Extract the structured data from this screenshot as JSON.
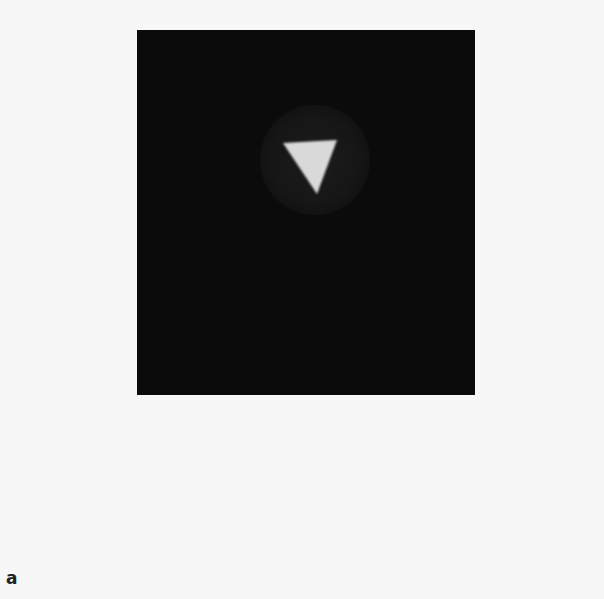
{
  "figure": {
    "panel_label": "a",
    "panel_color": "#0b0b0b",
    "background_color": "#f7f7f7",
    "shape": {
      "type": "inverted-triangle",
      "fill": "#d9d9d9",
      "points": "146,113 200,110 180,164"
    }
  }
}
